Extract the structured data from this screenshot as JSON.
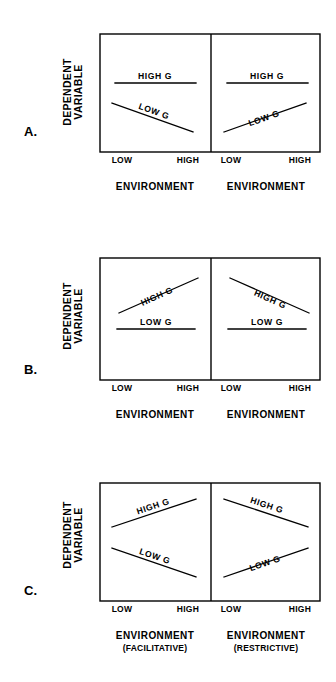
{
  "figure": {
    "background_color": "#ffffff",
    "line_color": "#000000",
    "text_color": "#000000",
    "width": 336,
    "height": 682
  },
  "labels": {
    "y_axis_line1": "DEPENDENT",
    "y_axis_line2": "VARIABLE",
    "tick_low": "LOW",
    "tick_high": "HIGH",
    "x_axis": "ENVIRONMENT",
    "series_high": "HIGH  G",
    "series_low": "LOW  G",
    "sub_facilitative": "(FACILITATIVE)",
    "sub_restrictive": "(RESTRICTIVE)"
  },
  "panels": [
    {
      "letter": "A.",
      "letter_x": 24,
      "letter_y": 136,
      "y_label_x": 76,
      "y_label_cy": 92,
      "box": {
        "x": 100,
        "y": 34,
        "width": 220,
        "height": 118,
        "divider_x": 211
      },
      "subpanels": [
        {
          "name": "left",
          "x_label": "ENVIRONMENT",
          "sub_label": "",
          "tick_low_x": 122,
          "tick_high_x": 188,
          "tick_y": 163,
          "x_label_x": 155,
          "x_label_y": 190,
          "series": [
            {
              "name": "HIGH  G",
              "kind": "high",
              "x1": 115,
              "y1": 83,
              "x2": 196,
              "y2": 83,
              "label_x": 155,
              "label_y": 79,
              "label_rot": 0
            },
            {
              "name": "LOW  G",
              "kind": "low",
              "x1": 112,
              "y1": 103,
              "x2": 193,
              "y2": 132,
              "label_x": 153,
              "label_y": 114,
              "label_rot": 19.7
            }
          ]
        },
        {
          "name": "right",
          "x_label": "ENVIRONMENT",
          "sub_label": "",
          "tick_low_x": 231,
          "tick_high_x": 300,
          "tick_y": 163,
          "x_label_x": 266,
          "x_label_y": 190,
          "series": [
            {
              "name": "HIGH  G",
              "kind": "high",
              "x1": 227,
              "y1": 83,
              "x2": 308,
              "y2": 83,
              "label_x": 267,
              "label_y": 79,
              "label_rot": 0
            },
            {
              "name": "LOW  G",
              "kind": "low",
              "x1": 224,
              "y1": 132,
              "x2": 306,
              "y2": 103,
              "label_x": 265,
              "label_y": 121,
              "label_rot": -19.5
            }
          ]
        }
      ]
    },
    {
      "letter": "B.",
      "letter_x": 24,
      "letter_y": 374,
      "y_label_x": 76,
      "y_label_cy": 316,
      "box": {
        "x": 100,
        "y": 258,
        "width": 220,
        "height": 122,
        "divider_x": 211
      },
      "subpanels": [
        {
          "name": "left",
          "x_label": "ENVIRONMENT",
          "sub_label": "",
          "tick_low_x": 122,
          "tick_high_x": 188,
          "tick_y": 391,
          "x_label_x": 155,
          "x_label_y": 418,
          "series": [
            {
              "name": "HIGH  G",
              "kind": "high",
              "x1": 119,
              "y1": 313,
              "x2": 198,
              "y2": 278,
              "label_x": 158,
              "label_y": 299,
              "label_rot": -23.9
            },
            {
              "name": "LOW  G",
              "kind": "low",
              "x1": 117,
              "y1": 329,
              "x2": 195,
              "y2": 329,
              "label_x": 156,
              "label_y": 325,
              "label_rot": 0
            }
          ]
        },
        {
          "name": "right",
          "x_label": "ENVIRONMENT",
          "sub_label": "",
          "tick_low_x": 231,
          "tick_high_x": 300,
          "tick_y": 391,
          "x_label_x": 266,
          "x_label_y": 418,
          "series": [
            {
              "name": "HIGH  G",
              "kind": "high",
              "x1": 230,
              "y1": 278,
              "x2": 309,
              "y2": 313,
              "label_x": 269,
              "label_y": 302,
              "label_rot": 23.9
            },
            {
              "name": "LOW  G",
              "kind": "low",
              "x1": 228,
              "y1": 329,
              "x2": 306,
              "y2": 329,
              "label_x": 267,
              "label_y": 325,
              "label_rot": 0
            }
          ]
        }
      ]
    },
    {
      "letter": "C.",
      "letter_x": 24,
      "letter_y": 595,
      "y_label_x": 76,
      "y_label_cy": 535,
      "box": {
        "x": 100,
        "y": 483,
        "width": 220,
        "height": 118,
        "divider_x": 211
      },
      "subpanels": [
        {
          "name": "left",
          "x_label": "ENVIRONMENT",
          "sub_label": "(FACILITATIVE)",
          "tick_low_x": 122,
          "tick_high_x": 188,
          "tick_y": 612,
          "x_label_x": 155,
          "x_label_y": 639,
          "sub_label_x": 155,
          "sub_label_y": 651,
          "series": [
            {
              "name": "HIGH  G",
              "kind": "high",
              "x1": 112,
              "y1": 527,
              "x2": 196,
              "y2": 499,
              "label_x": 154,
              "label_y": 509,
              "label_rot": -18.4
            },
            {
              "name": "LOW  G",
              "kind": "low",
              "x1": 112,
              "y1": 548,
              "x2": 196,
              "y2": 577,
              "label_x": 154,
              "label_y": 559,
              "label_rot": 19.0
            }
          ]
        },
        {
          "name": "right",
          "x_label": "ENVIRONMENT",
          "sub_label": "(RESTRICTIVE)",
          "tick_low_x": 231,
          "tick_high_x": 300,
          "tick_y": 612,
          "x_label_x": 266,
          "x_label_y": 639,
          "sub_label_x": 266,
          "sub_label_y": 651,
          "series": [
            {
              "name": "HIGH  G",
              "kind": "high",
              "x1": 224,
              "y1": 499,
              "x2": 308,
              "y2": 527,
              "label_x": 266,
              "label_y": 508,
              "label_rot": 18.4
            },
            {
              "name": "LOW  G",
              "kind": "low",
              "x1": 224,
              "y1": 577,
              "x2": 308,
              "y2": 548,
              "label_x": 266,
              "label_y": 566,
              "label_rot": -19.0
            }
          ]
        }
      ]
    }
  ],
  "chart_data": {
    "type": "line",
    "xlabel": "ENVIRONMENT",
    "ylabel": "DEPENDENT VARIABLE",
    "x": [
      "LOW",
      "HIGH"
    ],
    "xlim": [
      "LOW",
      "HIGH"
    ],
    "grid": false,
    "legend": "inline-labels",
    "panels": [
      {
        "panel": "A.",
        "subpanel": "left",
        "environment_qualifier": "",
        "series": [
          {
            "name": "HIGH  G",
            "values": [
              0.72,
              0.72
            ],
            "slope": "flat"
          },
          {
            "name": "LOW  G",
            "values": [
              0.55,
              0.3
            ],
            "slope": "decreasing"
          }
        ]
      },
      {
        "panel": "A.",
        "subpanel": "right",
        "environment_qualifier": "",
        "series": [
          {
            "name": "HIGH  G",
            "values": [
              0.72,
              0.72
            ],
            "slope": "flat"
          },
          {
            "name": "LOW  G",
            "values": [
              0.3,
              0.55
            ],
            "slope": "increasing"
          }
        ]
      },
      {
        "panel": "B.",
        "subpanel": "left",
        "environment_qualifier": "",
        "series": [
          {
            "name": "HIGH  G",
            "values": [
              0.55,
              0.84
            ],
            "slope": "increasing"
          },
          {
            "name": "LOW  G",
            "values": [
              0.42,
              0.42
            ],
            "slope": "flat"
          }
        ]
      },
      {
        "panel": "B.",
        "subpanel": "right",
        "environment_qualifier": "",
        "series": [
          {
            "name": "HIGH  G",
            "values": [
              0.84,
              0.55
            ],
            "slope": "decreasing"
          },
          {
            "name": "LOW  G",
            "values": [
              0.42,
              0.42
            ],
            "slope": "flat"
          }
        ]
      },
      {
        "panel": "C.",
        "subpanel": "left",
        "environment_qualifier": "(FACILITATIVE)",
        "series": [
          {
            "name": "HIGH  G",
            "values": [
              0.63,
              0.87
            ],
            "slope": "increasing"
          },
          {
            "name": "LOW  G",
            "values": [
              0.45,
              0.2
            ],
            "slope": "decreasing"
          }
        ]
      },
      {
        "panel": "C.",
        "subpanel": "right",
        "environment_qualifier": "(RESTRICTIVE)",
        "series": [
          {
            "name": "HIGH  G",
            "values": [
              0.87,
              0.63
            ],
            "slope": "decreasing"
          },
          {
            "name": "LOW  G",
            "values": [
              0.2,
              0.45
            ],
            "slope": "increasing"
          }
        ]
      }
    ]
  }
}
